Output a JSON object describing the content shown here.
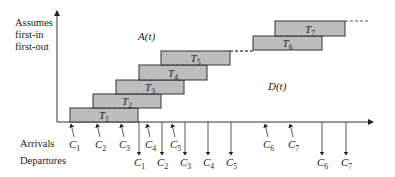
{
  "diagram": {
    "assumption_label": [
      "Assumes",
      "first-in",
      "first-out"
    ],
    "curve_labels": {
      "arrival": "A(t)",
      "departure": "D(t)"
    },
    "row_labels": {
      "arrivals": "Arrivals",
      "departures": "Departures"
    },
    "boxes": [
      {
        "label": "T",
        "sub": "1",
        "x": 70,
        "y": 108,
        "w": 68,
        "h": 14
      },
      {
        "label": "T",
        "sub": "2",
        "x": 93,
        "y": 94,
        "w": 68,
        "h": 14
      },
      {
        "label": "T",
        "sub": "3",
        "x": 116,
        "y": 80,
        "w": 68,
        "h": 14
      },
      {
        "label": "T",
        "sub": "4",
        "x": 139,
        "y": 65,
        "w": 68,
        "h": 15
      },
      {
        "label": "T",
        "sub": "5",
        "x": 161,
        "y": 51,
        "w": 69,
        "h": 14
      },
      {
        "label": "T",
        "sub": "6",
        "x": 253,
        "y": 36,
        "w": 69,
        "h": 14
      },
      {
        "label": "T",
        "sub": "7",
        "x": 275,
        "y": 21,
        "w": 70,
        "h": 15
      }
    ],
    "arrivals": [
      {
        "label": "C",
        "sub": "1",
        "x": 71
      },
      {
        "label": "C",
        "sub": "2",
        "x": 97
      },
      {
        "label": "C",
        "sub": "3",
        "x": 121
      },
      {
        "label": "C",
        "sub": "4",
        "x": 147
      },
      {
        "label": "C",
        "sub": "5",
        "x": 172
      },
      {
        "label": "C",
        "sub": "6",
        "x": 265
      },
      {
        "label": "C",
        "sub": "7",
        "x": 290
      }
    ],
    "departures": [
      {
        "label": "C",
        "sub": "1",
        "x": 139
      },
      {
        "label": "C",
        "sub": "2",
        "x": 162
      },
      {
        "label": "C",
        "sub": "3",
        "x": 185
      },
      {
        "label": "C",
        "sub": "4",
        "x": 208
      },
      {
        "label": "C",
        "sub": "5",
        "x": 231
      },
      {
        "label": "C",
        "sub": "6",
        "x": 322
      },
      {
        "label": "C",
        "sub": "7",
        "x": 346
      }
    ],
    "colors": {
      "box_fill": "#bdbdbd",
      "stroke": "#333333"
    }
  }
}
